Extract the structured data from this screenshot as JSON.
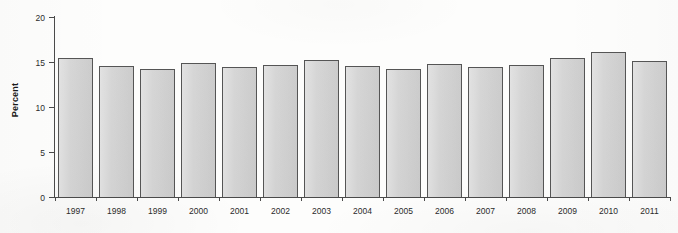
{
  "chart_data": {
    "type": "bar",
    "title": "",
    "xlabel": "",
    "ylabel": "Percent",
    "categories": [
      "1997",
      "1998",
      "1999",
      "2000",
      "2001",
      "2002",
      "2003",
      "2004",
      "2005",
      "2006",
      "2007",
      "2008",
      "2009",
      "2010",
      "2011"
    ],
    "values": [
      15.4,
      14.6,
      14.2,
      14.9,
      14.4,
      14.7,
      15.2,
      14.6,
      14.2,
      14.8,
      14.5,
      14.7,
      15.4,
      16.1,
      15.1
    ],
    "ylim": [
      0,
      20
    ],
    "yticks": [
      0,
      5,
      10,
      15,
      20
    ],
    "ytick_labels": [
      "0",
      "5",
      "10",
      "15",
      "20"
    ],
    "grid": false,
    "legend": null,
    "bar_color": "#d3d3d3",
    "bar_edge_color": "#555555",
    "axis_color": "#4a4a4a",
    "background_color": "#fdfdfc"
  }
}
